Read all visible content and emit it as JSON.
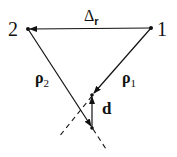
{
  "diagram": {
    "points": [
      {
        "id": "2",
        "label": "2",
        "x": 28,
        "y": 29
      },
      {
        "id": "1",
        "label": "1",
        "x": 151,
        "y": 28
      }
    ],
    "labels": {
      "delta_r": "Δr",
      "delta_main": "Δ",
      "delta_sub": "r",
      "rho1_main": "ρ",
      "rho1_sub": "1",
      "rho2_main": "ρ",
      "rho2_sub": "2",
      "d": "d"
    },
    "vectors": [
      {
        "name": "delta-r",
        "from": "1",
        "to": "2"
      },
      {
        "name": "rho1",
        "from": "1",
        "to": "P1"
      },
      {
        "name": "rho2",
        "from": "2",
        "to": "P2"
      },
      {
        "name": "d",
        "from": "P2",
        "to": "P1"
      }
    ],
    "colors": {
      "ink": "#111111"
    }
  }
}
